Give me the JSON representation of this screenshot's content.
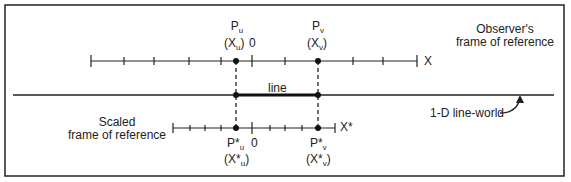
{
  "diagram": {
    "observer_frame": {
      "line1": "Observer's",
      "line2": "frame of reference",
      "axis_label": "X",
      "zero_label": "0"
    },
    "scaled_frame": {
      "line1": "Scaled",
      "line2": "frame of reference",
      "axis_label": "X*",
      "zero_label": "0"
    },
    "points": {
      "pu": {
        "name": "P",
        "sub": "u",
        "coord": "(X",
        "coord_sub": "u",
        "close": ")"
      },
      "pv": {
        "name": "P",
        "sub": "v",
        "coord": "(X",
        "coord_sub": "v",
        "close": ")"
      },
      "psu": {
        "name": "P*",
        "sub": "u",
        "coord": "(X*",
        "coord_sub": "u",
        "close": ")"
      },
      "psv": {
        "name": "P*",
        "sub": "v",
        "coord": "(X*",
        "coord_sub": "v",
        "close": ")"
      }
    },
    "segment_label": "line",
    "world_label": "1-D line-world"
  }
}
